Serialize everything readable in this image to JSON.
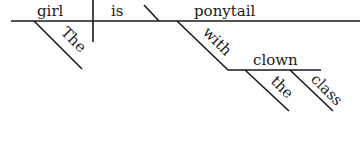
{
  "diagram": {
    "type": "sentence-diagram",
    "sentence_words": [
      "The",
      "girl",
      "is",
      "with",
      "the",
      "class",
      "clown",
      "ponytail"
    ],
    "subject": "girl",
    "verb": "is",
    "complement": "ponytail",
    "modifiers": {
      "subject_article": "The",
      "preposition": "with",
      "object": "clown",
      "object_article": "the",
      "object_adjective": "class"
    }
  }
}
